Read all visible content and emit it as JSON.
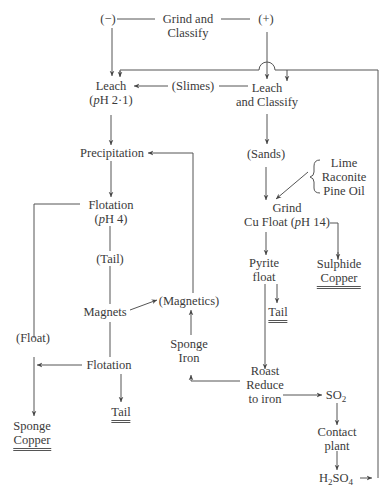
{
  "diagram": {
    "type": "process-flowsheet",
    "nodes": {
      "minus": {
        "lines": [
          "(−)"
        ]
      },
      "grind_classify": {
        "lines": [
          "Grind and",
          "Classify"
        ]
      },
      "plus": {
        "lines": [
          "(+)"
        ]
      },
      "leach_ph": {
        "lines": [
          "Leach",
          "(pH 2·1)"
        ]
      },
      "slimes": {
        "lines": [
          "(Slimes)"
        ]
      },
      "leach_classify": {
        "lines": [
          "Leach",
          "and Classify"
        ]
      },
      "precipitation": {
        "lines": [
          "Precipitation"
        ]
      },
      "sands": {
        "lines": [
          "(Sands)"
        ]
      },
      "reagents": {
        "lines": [
          "Lime",
          "Raconite",
          "Pine Oil"
        ]
      },
      "flotation_ph4": {
        "lines": [
          "Flotation",
          "(pH 4)"
        ]
      },
      "grind_cu_float": {
        "lines": [
          "Grind",
          "Cu Float (pH 14)"
        ]
      },
      "tail_mid": {
        "lines": [
          "(Tail)"
        ]
      },
      "pyrite_float": {
        "lines": [
          "Pyrite",
          "float"
        ]
      },
      "sulphide_copper": {
        "lines": [
          "Sulphide",
          "Copper"
        ]
      },
      "magnets": {
        "lines": [
          "Magnets"
        ]
      },
      "magnetics": {
        "lines": [
          "(Magnetics)"
        ]
      },
      "tail_pyrite": {
        "lines": [
          "Tail"
        ]
      },
      "float": {
        "lines": [
          "(Float)"
        ]
      },
      "sponge_iron": {
        "lines": [
          "Sponge",
          "Iron"
        ]
      },
      "flotation": {
        "lines": [
          "Flotation"
        ]
      },
      "roast": {
        "lines": [
          "Roast",
          "Reduce",
          "to iron"
        ]
      },
      "so2": {
        "text": "SO",
        "sub": "2"
      },
      "tail_bottom": {
        "lines": [
          "Tail"
        ]
      },
      "sponge_copper": {
        "lines": [
          "Sponge",
          "Copper"
        ]
      },
      "contact_plant": {
        "lines": [
          "Contact",
          "plant"
        ]
      },
      "h2so4": {
        "pre": "H",
        "sub1": "2",
        "mid": "SO",
        "sub2": "4"
      }
    },
    "final_products": [
      "Sulphide Copper",
      "Tail",
      "Tail",
      "Sponge Copper"
    ],
    "edges": [
      [
        "Grind and Classify",
        "(−)"
      ],
      [
        "Grind and Classify",
        "(+)"
      ],
      [
        "(−)",
        "Leach (pH 2·1)"
      ],
      [
        "(+)",
        "Leach and Classify"
      ],
      [
        "Leach and Classify",
        "Leach (pH 2·1)",
        "(Slimes)"
      ],
      [
        "H2SO4",
        "Leach (pH 2·1)"
      ],
      [
        "H2SO4",
        "Leach and Classify"
      ],
      [
        "Leach (pH 2·1)",
        "Precipitation"
      ],
      [
        "Leach and Classify",
        "(Sands)"
      ],
      [
        "(Sands)",
        "Grind Cu Float (pH 14)"
      ],
      [
        "Lime / Raconite / Pine Oil",
        "Grind Cu Float (pH 14)"
      ],
      [
        "Grind Cu Float (pH 14)",
        "Sulphide Copper"
      ],
      [
        "Grind Cu Float (pH 14)",
        "Pyrite float"
      ],
      [
        "Pyrite float",
        "Tail"
      ],
      [
        "Pyrite float",
        "Roast Reduce to iron"
      ],
      [
        "Roast Reduce to iron",
        "Sponge Iron"
      ],
      [
        "Roast Reduce to iron",
        "SO2"
      ],
      [
        "SO2",
        "Contact plant"
      ],
      [
        "Contact plant",
        "H2SO4"
      ],
      [
        "Sponge Iron",
        "(Magnetics)"
      ],
      [
        "(Magnetics)",
        "Precipitation"
      ],
      [
        "Precipitation",
        "Flotation (pH 4)"
      ],
      [
        "Flotation (pH 4)",
        "(Tail)"
      ],
      [
        "(Tail)",
        "Magnets"
      ],
      [
        "Magnets",
        "(Magnetics)"
      ],
      [
        "Magnets",
        "Flotation"
      ],
      [
        "Flotation (pH 4)",
        "Sponge Copper",
        "(Float)"
      ],
      [
        "Flotation",
        "Sponge Copper"
      ],
      [
        "Flotation",
        "Tail"
      ]
    ]
  }
}
